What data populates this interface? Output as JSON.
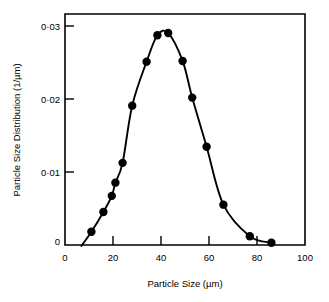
{
  "figure": {
    "background_color": "#ffffff",
    "ink_color": "#000000"
  },
  "chart_data": {
    "type": "scatter",
    "title": "",
    "subtitle": "",
    "xlabel": "Particle Size (µm)",
    "ylabel": "Particle Size Distribution (1/µm)",
    "xlim": [
      0,
      100
    ],
    "ylim": [
      0,
      0.0315
    ],
    "xticks": [
      0,
      20,
      40,
      60,
      80,
      100
    ],
    "xtick_labels": [
      "0",
      "20",
      "40",
      "60",
      "80",
      "100"
    ],
    "yticks": [
      0,
      0.01,
      0.02,
      0.03
    ],
    "ytick_labels": [
      "0",
      "0·01",
      "0·02",
      "0·03"
    ],
    "grid": false,
    "legend": false,
    "legend_position": "none",
    "marker": "filled-circle",
    "line_style": "smooth-solid",
    "x": [
      11,
      16,
      19.5,
      21,
      24,
      28,
      34,
      38.5,
      43,
      49,
      53,
      59,
      66,
      77,
      86
    ],
    "y": [
      0.0018,
      0.0045,
      0.0067,
      0.0085,
      0.0112,
      0.019,
      0.025,
      0.0286,
      0.0289,
      0.0251,
      0.0201,
      0.0134,
      0.0055,
      0.0012,
      0.0003
    ],
    "series": [
      {
        "name": "Particle size distribution",
        "x": [
          11,
          16,
          19.5,
          21,
          24,
          28,
          34,
          38.5,
          43,
          49,
          53,
          59,
          66,
          77,
          86
        ],
        "values": [
          0.0018,
          0.0045,
          0.0067,
          0.0085,
          0.0112,
          0.019,
          0.025,
          0.0286,
          0.0289,
          0.0251,
          0.0201,
          0.0134,
          0.0055,
          0.0012,
          0.0003
        ]
      }
    ],
    "annotations": []
  },
  "axes": {
    "x_title": "Particle Size (µm)",
    "y_title": "Particle Size Distribution (1/µm)",
    "x_tick_labels": [
      "0",
      "20",
      "40",
      "60",
      "80",
      "100"
    ],
    "y_tick_labels": [
      "0",
      "0·01",
      "0·02",
      "0·03"
    ]
  }
}
